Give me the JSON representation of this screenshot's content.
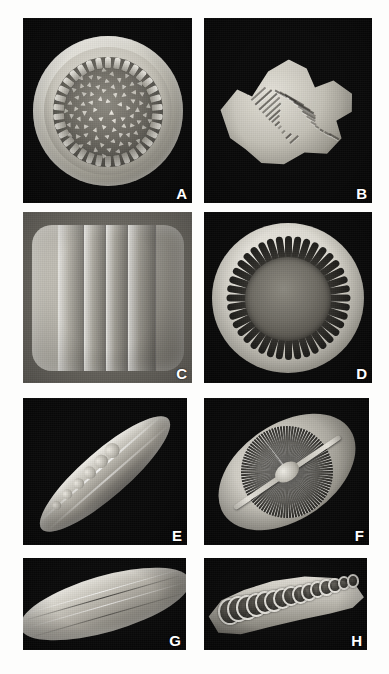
{
  "figure": {
    "type": "sem-micrograph-plate",
    "background_color": "#fdfdfc",
    "panel_background_color": "#0a0a0a",
    "label_color": "#ffffff",
    "columns": 2,
    "rows": 4,
    "total_panels": 8
  },
  "panels": [
    {
      "label": "A",
      "name": "panel-a",
      "subject": "centric diatom valve, internal view",
      "description": "Circular frustule with raised mantle ring, marginal row of short spokes and scattered triangular areolae across the valve face",
      "shape": "circular",
      "marginal_spokes": 34,
      "areolae_count": 78,
      "view": "valve-interior"
    },
    {
      "label": "B",
      "name": "panel-b",
      "subject": "cruciform stellate frustule",
      "description": "Four-armed star-shaped valve in oblique view with transverse striae running along each arm",
      "shape": "cruciform",
      "arms": 4,
      "striae_count": 26,
      "view": "oblique"
    },
    {
      "label": "C",
      "name": "panel-c",
      "subject": "frustule in girdle view",
      "description": "Rounded-rectangular frustule showing overlapping copulae bands with dense puncta rows on either margin",
      "shape": "rounded-rectangle",
      "girdle_bands": 4,
      "view": "girdle"
    },
    {
      "label": "D",
      "name": "panel-d",
      "subject": "centric valve with radial slots",
      "description": "Circular valve with a smooth central area surrounded by a ring of elongate radial slot openings",
      "shape": "circular",
      "radial_slots": 40,
      "view": "valve-exterior"
    },
    {
      "label": "E",
      "name": "panel-e",
      "subject": "naviculoid frustule, oblique view",
      "description": "Elongate lanceolate frustule tilted diagonally, showing keel ridge and a series of rounded nodules along the upper margin",
      "shape": "lanceolate",
      "nodules": 6,
      "orientation_degrees": -41,
      "view": "oblique"
    },
    {
      "label": "F",
      "name": "panel-f",
      "subject": "elliptical valve with dense striae",
      "description": "Broad elliptical valve with closely spaced radiating striae, a straight axial raphe and a raised central nodule",
      "shape": "elliptical",
      "striae_count": 96,
      "orientation_degrees": -34,
      "view": "valve-exterior"
    },
    {
      "label": "G",
      "name": "panel-g",
      "subject": "lanceolate valve, smooth surface",
      "description": "Narrow lanceolate frustule with pointed apices, longitudinal ribs and a fine marginal stria row",
      "shape": "lanceolate",
      "orientation_degrees": -16,
      "view": "valve-exterior"
    },
    {
      "label": "H",
      "name": "panel-h",
      "subject": "arcuate chambered frustule",
      "description": "Curved wedge-shaped frustule in oblique view showing a row of large open loculate chambers decreasing in size toward one apex",
      "shape": "arcuate",
      "chambers": 15,
      "view": "oblique"
    }
  ]
}
